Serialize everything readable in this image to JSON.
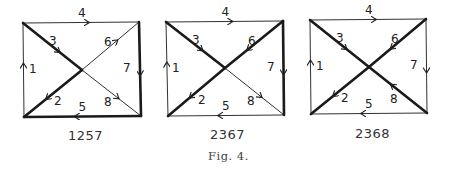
{
  "figure_caption": "Fig. 4.",
  "diagrams": [
    {
      "id": "1257",
      "label": "1257",
      "thick_edges": [
        "2",
        "3",
        "5",
        "7"
      ],
      "corners": {
        "tl": [
          23,
          23
        ],
        "tr": [
          139,
          22
        ],
        "br": [
          141,
          116
        ],
        "bl": [
          24,
          117
        ]
      },
      "center": [
        82,
        70
      ]
    },
    {
      "id": "2367",
      "label": "2367",
      "thick_edges": [
        "2",
        "3",
        "6",
        "7"
      ],
      "corners": {
        "tl": [
          166,
          22
        ],
        "tr": [
          283,
          21
        ],
        "br": [
          284,
          115
        ],
        "bl": [
          168,
          116
        ]
      },
      "center": [
        225,
        68
      ]
    },
    {
      "id": "2368",
      "label": "2368",
      "thick_edges": [
        "2",
        "3",
        "6",
        "8"
      ],
      "corners": {
        "tl": [
          310,
          20
        ],
        "tr": [
          426,
          19
        ],
        "br": [
          427,
          113
        ],
        "bl": [
          311,
          114
        ]
      },
      "center": [
        369,
        67
      ]
    }
  ],
  "edge_labels": [
    "1",
    "2",
    "3",
    "4",
    "5",
    "6",
    "7",
    "8"
  ],
  "edges": {
    "1": {
      "from": "bl",
      "to": "tl",
      "desc": "left side, upward"
    },
    "2": {
      "from": "center",
      "to": "bl",
      "desc": "lower-left diagonal half"
    },
    "3": {
      "from": "tl",
      "to": "center",
      "desc": "upper-left diagonal half"
    },
    "4": {
      "from": "tl",
      "to": "tr",
      "desc": "top side, rightward"
    },
    "5": {
      "from": "br",
      "to": "bl",
      "desc": "bottom side, leftward"
    },
    "6": {
      "desc": "upper-right diagonal half"
    },
    "7": {
      "from": "tr",
      "to": "br",
      "desc": "right side, downward"
    },
    "8": {
      "desc": "lower-right diagonal half"
    }
  },
  "edge6_direction": {
    "1257": "center_to_tr",
    "2367": "tr_to_center",
    "2368": "tr_to_center"
  },
  "edge8_direction": {
    "1257": "center_to_br",
    "2367": "center_to_br",
    "2368": "br_to_center"
  }
}
